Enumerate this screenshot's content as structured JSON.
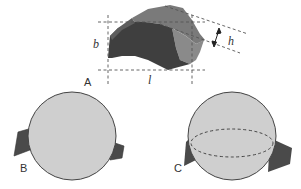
{
  "panels": [
    {
      "id": "A",
      "label": "A",
      "description": "irregular particle with bounding dimensions"
    },
    {
      "id": "B",
      "label": "B",
      "description": "sphere with protruding particle outline"
    },
    {
      "id": "C",
      "label": "C",
      "description": "sphere with equatorial ellipse and particle outline"
    }
  ],
  "dimensions": {
    "length": "l",
    "breadth": "b",
    "height": "h"
  },
  "colors": {
    "particle_dark": "#3f3f3f",
    "particle_mid": "#5e5e5e",
    "particle_light": "#8a8a8a",
    "sphere_fill": "#cfcfcf",
    "outline": "#444444",
    "dashed": "#555555"
  }
}
